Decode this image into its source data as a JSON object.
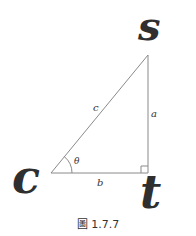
{
  "diagram": {
    "vertices": [
      {
        "id": "C",
        "label": "c",
        "x": 51,
        "y": 173
      },
      {
        "id": "T",
        "label": "t",
        "x": 148,
        "y": 173
      },
      {
        "id": "S",
        "label": "s",
        "x": 148,
        "y": 55
      }
    ],
    "sides": {
      "hypotenuse": "c",
      "opposite": "a",
      "adjacent": "b"
    },
    "angle_label": "θ",
    "right_angle_at": "t",
    "caption": "圖 1.7.7",
    "colors": {
      "line": "#8a8a8a",
      "text": "#333333",
      "vertex_label": "#2f2f2f"
    }
  }
}
